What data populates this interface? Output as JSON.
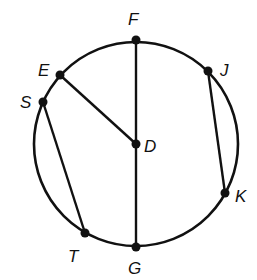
{
  "diagram": {
    "type": "circle-geometry",
    "circle": {
      "cx": 136,
      "cy": 144,
      "r": 102
    },
    "points": [
      {
        "id": "F",
        "label": "F",
        "x": 136,
        "y": 40,
        "lx": 128,
        "ly": 25
      },
      {
        "id": "E",
        "label": "E",
        "x": 60,
        "y": 75,
        "lx": 38,
        "ly": 76
      },
      {
        "id": "S",
        "label": "S",
        "x": 43,
        "y": 102,
        "lx": 20,
        "ly": 108
      },
      {
        "id": "D",
        "label": "D",
        "x": 136,
        "y": 144,
        "lx": 144,
        "ly": 152
      },
      {
        "id": "J",
        "label": "J",
        "x": 208,
        "y": 71,
        "lx": 220,
        "ly": 76
      },
      {
        "id": "K",
        "label": "K",
        "x": 225,
        "y": 193,
        "lx": 235,
        "ly": 202
      },
      {
        "id": "T",
        "label": "T",
        "x": 85,
        "y": 233,
        "lx": 68,
        "ly": 262
      },
      {
        "id": "G",
        "label": "G",
        "x": 136,
        "y": 247,
        "lx": 128,
        "ly": 274
      }
    ],
    "segments": [
      {
        "from": "F",
        "to": "G",
        "name": "diameter-FG"
      },
      {
        "from": "E",
        "to": "D",
        "name": "radius-ED"
      },
      {
        "from": "S",
        "to": "T",
        "name": "chord-ST"
      },
      {
        "from": "J",
        "to": "K",
        "name": "chord-JK"
      }
    ],
    "colors": {
      "stroke": "#111111",
      "background": "#ffffff"
    }
  }
}
